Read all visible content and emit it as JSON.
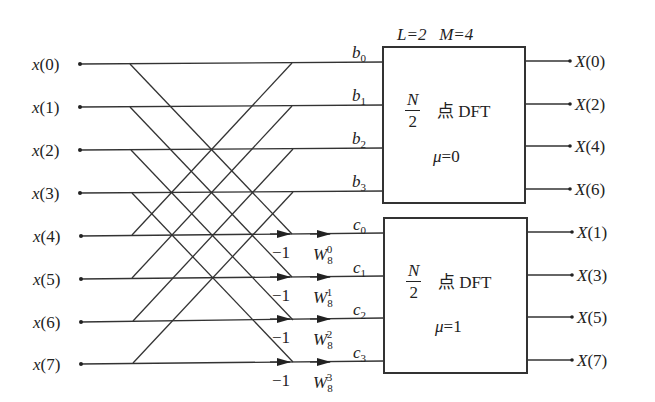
{
  "diagram": {
    "params_label": "L=2   M=4",
    "params": {
      "L": 2,
      "M": 4
    },
    "inputs": [
      "x(0)",
      "x(1)",
      "x(2)",
      "x(3)",
      "x(4)",
      "x(5)",
      "x(6)",
      "x(7)"
    ],
    "upper_intermediate": [
      "b",
      "b",
      "b",
      "b"
    ],
    "upper_subscripts": [
      "0",
      "1",
      "2",
      "3"
    ],
    "lower_intermediate": [
      "c",
      "c",
      "c",
      "c"
    ],
    "lower_subscripts": [
      "0",
      "1",
      "2",
      "3"
    ],
    "minus_one_labels": [
      "−1",
      "−1",
      "−1",
      "−1"
    ],
    "twiddle_base": [
      "W",
      "W",
      "W",
      "W"
    ],
    "twiddle_sub": [
      "8",
      "8",
      "8",
      "8"
    ],
    "twiddle_exp": [
      "0",
      "1",
      "2",
      "3"
    ],
    "upper_block": {
      "frac_num": "N",
      "frac_den": "2",
      "text": "点 DFT",
      "mu_label": "μ=0"
    },
    "lower_block": {
      "frac_num": "N",
      "frac_den": "2",
      "text": "点 DFT",
      "mu_label": "μ=1"
    },
    "upper_outputs": [
      "X(0)",
      "X(2)",
      "X(4)",
      "X(6)"
    ],
    "lower_outputs": [
      "X(1)",
      "X(3)",
      "X(5)",
      "X(7)"
    ],
    "colors": {
      "line": "#333333",
      "text": "#222222",
      "background": "#ffffff"
    }
  }
}
